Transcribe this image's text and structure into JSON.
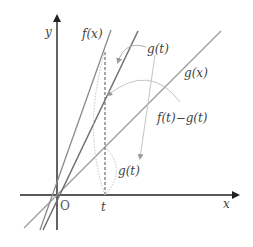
{
  "diagram": {
    "type": "function-graph",
    "axes": {
      "x_label": "x",
      "y_label": "y",
      "origin_label": "O",
      "t_label": "t"
    },
    "curves": [
      {
        "name": "f",
        "label": "f(x)",
        "kind": "line-through-origin"
      },
      {
        "name": "h",
        "label": "",
        "kind": "line-through-origin"
      },
      {
        "name": "g",
        "label": "g(x)",
        "kind": "line-through-origin"
      }
    ],
    "annotations": {
      "upper_g_t": "g(t)",
      "difference": "f(t)−g(t)",
      "lower_g_t": "g(t)"
    },
    "colors": {
      "axis": "#222222",
      "line_f": "#8a8a8a",
      "line_h": "#6a6a6a",
      "line_g": "#9a9a9a",
      "dashed": "#777777",
      "annotation_arrow": "#b0b0b0"
    }
  }
}
